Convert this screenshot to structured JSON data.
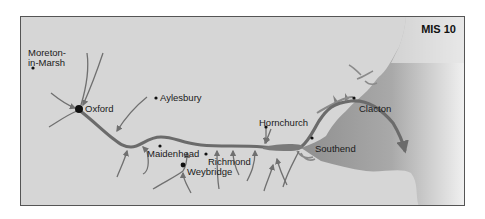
{
  "map": {
    "title": "MIS 10",
    "colors": {
      "land": "#d6d6d6",
      "sea": "#8f8f8f",
      "river": "#6b6b6b",
      "tributary": "#707070",
      "border": "#555555",
      "text": "#1a1a1a"
    },
    "places": [
      {
        "id": "moreton",
        "label_line1": "Moreton-",
        "label_line2": "in-Marsh"
      },
      {
        "id": "oxford",
        "label": "Oxford"
      },
      {
        "id": "aylesbury",
        "label": "Aylesbury"
      },
      {
        "id": "maidenhead",
        "label": "Maidenhead"
      },
      {
        "id": "richmond",
        "label": "Richmond"
      },
      {
        "id": "weybridge",
        "label": "Weybridge"
      },
      {
        "id": "hornchurch",
        "label": "Hornchurch"
      },
      {
        "id": "southend",
        "label": "Southend"
      },
      {
        "id": "clacton",
        "label": "Clacton"
      }
    ]
  }
}
